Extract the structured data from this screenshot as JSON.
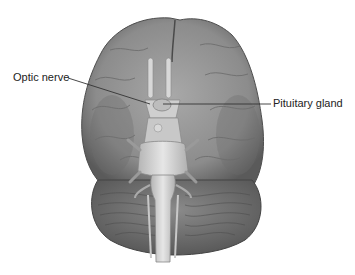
{
  "figure": {
    "labels": [
      {
        "id": "optic",
        "text": "Optic nerve",
        "line": {
          "x1": 68,
          "y1": 78,
          "x2": 150,
          "y2": 104
        }
      },
      {
        "id": "pituitary",
        "text": "Pituitary gland",
        "line": {
          "x1": 163,
          "y1": 104,
          "x2": 271,
          "y2": 104
        }
      }
    ],
    "colors": {
      "background": "#ffffff",
      "cortex": "#8f8f8f",
      "cortex_shadow": "#5e5e5e",
      "cerebellum": "#7a7a7a",
      "brainstem": "#d6d6d6",
      "leader_line": "#333333",
      "label_text": "#222222"
    }
  }
}
